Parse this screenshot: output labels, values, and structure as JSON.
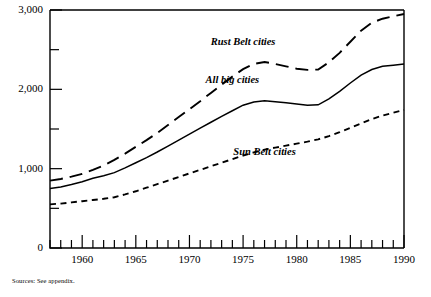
{
  "figure": {
    "source_note": "Sources: See appendix."
  },
  "chart_data": {
    "type": "line",
    "title": "",
    "xlabel": "",
    "ylabel": "",
    "xlim": [
      1957,
      1990
    ],
    "ylim": [
      0,
      3000
    ],
    "grid": false,
    "legend_position": "inline-annotations",
    "y_ticks_major": [
      0,
      1000,
      2000,
      3000
    ],
    "y_ticks_major_labels": [
      "0",
      "1,000",
      "2,000",
      "3,000"
    ],
    "y_ticks_minor": [
      500,
      1500,
      2500
    ],
    "x_ticks_labeled": [
      1960,
      1965,
      1970,
      1975,
      1980,
      1985,
      1990
    ],
    "x_ticks_labeled_text": [
      "1960",
      "1965",
      "1970",
      "1975",
      "1980",
      "1985",
      "1990"
    ],
    "x_ticks_minor_start": 1957,
    "x_ticks_minor_end": 1990,
    "x": [
      1957,
      1958,
      1959,
      1960,
      1961,
      1962,
      1963,
      1964,
      1965,
      1966,
      1967,
      1968,
      1969,
      1970,
      1971,
      1972,
      1973,
      1974,
      1975,
      1976,
      1977,
      1978,
      1979,
      1980,
      1981,
      1982,
      1983,
      1984,
      1985,
      1986,
      1987,
      1988,
      1989,
      1990
    ],
    "series": [
      {
        "name": "Rust Belt cities",
        "style": "long-dash",
        "label_x": 1975,
        "label_y": 2560,
        "values": [
          850,
          870,
          900,
          935,
          985,
          1040,
          1110,
          1190,
          1275,
          1360,
          1450,
          1550,
          1650,
          1750,
          1850,
          1955,
          2060,
          2160,
          2255,
          2320,
          2345,
          2320,
          2290,
          2260,
          2245,
          2250,
          2340,
          2460,
          2600,
          2740,
          2840,
          2890,
          2920,
          2950
        ]
      },
      {
        "name": "All big cities",
        "style": "solid",
        "label_x": 1974,
        "label_y": 2075,
        "values": [
          750,
          770,
          800,
          835,
          880,
          910,
          950,
          1010,
          1075,
          1140,
          1210,
          1285,
          1360,
          1435,
          1510,
          1585,
          1660,
          1730,
          1800,
          1840,
          1855,
          1845,
          1830,
          1815,
          1800,
          1805,
          1880,
          1975,
          2080,
          2180,
          2250,
          2290,
          2305,
          2320
        ]
      },
      {
        "name": "Sun Belt cities",
        "style": "short-dash",
        "label_x": 1977,
        "label_y": 1170,
        "values": [
          550,
          560,
          575,
          590,
          605,
          620,
          640,
          675,
          715,
          760,
          805,
          850,
          895,
          940,
          985,
          1030,
          1075,
          1120,
          1165,
          1205,
          1240,
          1265,
          1290,
          1315,
          1340,
          1370,
          1410,
          1460,
          1515,
          1570,
          1625,
          1670,
          1705,
          1740
        ]
      }
    ]
  }
}
